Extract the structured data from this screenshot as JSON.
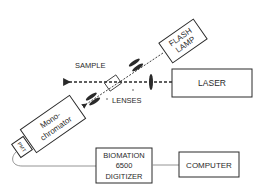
{
  "diagram": {
    "type": "experimental-apparatus",
    "components": {
      "flash_lamp": {
        "line1": "FLASH",
        "line2": "LAMP"
      },
      "laser": {
        "label": "LASER"
      },
      "sample": {
        "label": "SAMPLE"
      },
      "lenses": {
        "label": "LENSES"
      },
      "monochromator": {
        "line1": "Mono-",
        "line2": "chromator"
      },
      "pmt": {
        "label": "PMT"
      },
      "digitizer": {
        "line1": "BIOMATION",
        "line2": "6500",
        "line3": "DIGITIZER"
      },
      "computer": {
        "label": "COMPUTER"
      }
    },
    "colors": {
      "stroke": "#2a2a2a",
      "background": "#ffffff",
      "wire": "#888888"
    }
  }
}
